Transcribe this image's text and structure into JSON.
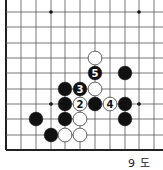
{
  "diagram": {
    "caption": "9 도",
    "colors": {
      "line": "#555555",
      "edge": "#222222",
      "black_stone": "#111111",
      "white_stone": "#ffffff",
      "stone_outline": "#222222"
    },
    "grid": {
      "x": [
        6,
        21,
        36,
        51,
        65,
        80,
        95,
        110,
        125,
        139,
        154
      ],
      "y": [
        12,
        27,
        43,
        58,
        73,
        89,
        104,
        119,
        135,
        150
      ],
      "top_extends": true,
      "right_extends": true,
      "left_edge": true,
      "bottom_edge": true
    },
    "star_points": [
      {
        "col": 3,
        "row": 0
      },
      {
        "col": 9,
        "row": 0
      },
      {
        "col": 3,
        "row": 6
      },
      {
        "col": 9,
        "row": 6
      }
    ],
    "stones": [
      {
        "color": "white",
        "col": 6,
        "row": 3,
        "label": ""
      },
      {
        "color": "black",
        "col": 6,
        "row": 4,
        "label": "5"
      },
      {
        "color": "black",
        "col": 8,
        "row": 4,
        "label": ""
      },
      {
        "color": "black",
        "col": 4,
        "row": 5,
        "label": ""
      },
      {
        "color": "black",
        "col": 5,
        "row": 5,
        "label": "3"
      },
      {
        "color": "white",
        "col": 6,
        "row": 5,
        "label": ""
      },
      {
        "color": "black",
        "col": 4,
        "row": 6,
        "label": ""
      },
      {
        "color": "white",
        "col": 5,
        "row": 6,
        "label": "2"
      },
      {
        "color": "black",
        "col": 6,
        "row": 6,
        "label": ""
      },
      {
        "color": "white",
        "col": 7,
        "row": 6,
        "label": "4"
      },
      {
        "color": "black",
        "col": 8,
        "row": 6,
        "label": ""
      },
      {
        "color": "black",
        "col": 2,
        "row": 7,
        "label": ""
      },
      {
        "color": "black",
        "col": 4,
        "row": 7,
        "label": ""
      },
      {
        "color": "white",
        "col": 5,
        "row": 7,
        "label": ""
      },
      {
        "color": "black",
        "col": 8,
        "row": 7,
        "label": ""
      },
      {
        "color": "black",
        "col": 3,
        "row": 8,
        "label": ""
      },
      {
        "color": "white",
        "col": 4,
        "row": 8,
        "label": ""
      },
      {
        "color": "white",
        "col": 5,
        "row": 8,
        "label": ""
      }
    ]
  }
}
